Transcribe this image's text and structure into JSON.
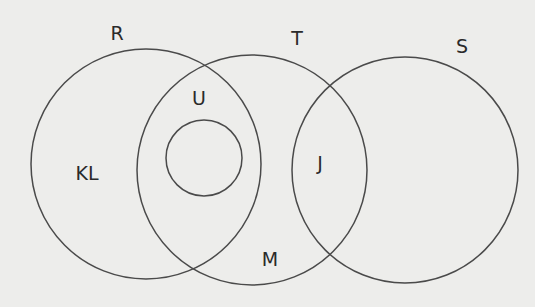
{
  "diagram": {
    "type": "venn",
    "stroke_color": "#4a4a4a",
    "background_color": "#ededeb",
    "circles": [
      {
        "id": "R",
        "label": "R",
        "cx": 146,
        "cy": 164,
        "r": 115
      },
      {
        "id": "T",
        "label": "T",
        "cx": 252,
        "cy": 170,
        "r": 115
      },
      {
        "id": "S",
        "label": "S",
        "cx": 405,
        "cy": 170,
        "r": 113
      },
      {
        "id": "inner",
        "label": "",
        "cx": 204,
        "cy": 158,
        "r": 38
      }
    ],
    "set_labels": {
      "R": "R",
      "T": "T",
      "S": "S"
    },
    "region_labels": {
      "U": "U",
      "KL": "KL",
      "J": "J",
      "M": "M"
    }
  }
}
